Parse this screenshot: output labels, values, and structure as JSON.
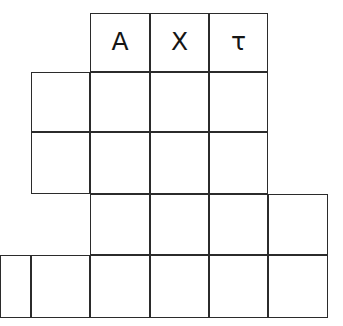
{
  "puzzle": {
    "kind": "staircase-letter-grid",
    "background_color": "#ffffff",
    "line_color": "#2b2b2b",
    "text_color": "#151515",
    "columns": 6,
    "rows": 5,
    "column_edges_px": [
      0,
      31,
      90,
      150,
      209,
      268,
      328
    ],
    "row_edges_px": [
      13,
      72,
      132,
      194,
      255,
      318
    ],
    "rows_data": [
      {
        "index": 0,
        "start_col": 2,
        "end_col": 5,
        "cells": [
          {
            "col": 2,
            "label": "A"
          },
          {
            "col": 3,
            "label": "X"
          },
          {
            "col": 4,
            "label": "τ"
          }
        ]
      },
      {
        "index": 1,
        "start_col": 1,
        "end_col": 5,
        "cells": [
          {
            "col": 1,
            "label": ""
          },
          {
            "col": 2,
            "label": ""
          },
          {
            "col": 3,
            "label": ""
          },
          {
            "col": 4,
            "label": ""
          }
        ]
      },
      {
        "index": 2,
        "start_col": 1,
        "end_col": 5,
        "cells": [
          {
            "col": 1,
            "label": ""
          },
          {
            "col": 2,
            "label": ""
          },
          {
            "col": 3,
            "label": ""
          },
          {
            "col": 4,
            "label": ""
          }
        ]
      },
      {
        "index": 3,
        "start_col": 2,
        "end_col": 6,
        "cells": [
          {
            "col": 2,
            "label": ""
          },
          {
            "col": 3,
            "label": ""
          },
          {
            "col": 4,
            "label": ""
          },
          {
            "col": 5,
            "label": ""
          }
        ]
      },
      {
        "index": 4,
        "start_col": 0,
        "end_col": 6,
        "cells": [
          {
            "col": 0,
            "label": ""
          },
          {
            "col": 1,
            "label": ""
          },
          {
            "col": 2,
            "label": ""
          },
          {
            "col": 3,
            "label": ""
          },
          {
            "col": 4,
            "label": ""
          },
          {
            "col": 5,
            "label": ""
          }
        ]
      }
    ],
    "filled_letters": [
      "A",
      "X",
      "τ"
    ]
  }
}
